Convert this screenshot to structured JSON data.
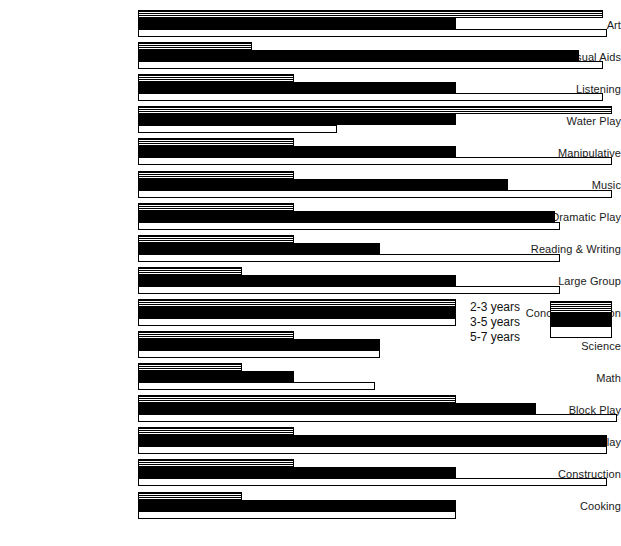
{
  "chart_data": {
    "type": "bar",
    "orientation": "horizontal",
    "title": "",
    "xlabel": "",
    "ylabel": "",
    "grid": false,
    "legend_position": "middle-right",
    "xlim": [
      0,
      100
    ],
    "categories": [
      "Art",
      "Visual Aids",
      "Listening",
      "Water Play",
      "Manipulative",
      "Music",
      "Dramatic Play",
      "Reading & Writing",
      "Large Group",
      "Concept Formation",
      "Science",
      "Math",
      "Block Play",
      "Indoor Active Play",
      "Construction",
      "Cooking"
    ],
    "series": [
      {
        "name": "2-3 years",
        "fill": "hatched",
        "values": [
          98,
          24,
          33,
          100,
          33,
          33,
          33,
          33,
          22,
          67,
          33,
          22,
          67,
          33,
          33,
          22
        ]
      },
      {
        "name": "3-5 years",
        "fill": "solid-black",
        "values": [
          67,
          93,
          67,
          67,
          67,
          78,
          88,
          51,
          67,
          67,
          51,
          33,
          84,
          99,
          67,
          67
        ]
      },
      {
        "name": "5-7 years",
        "fill": "white-outline",
        "values": [
          99,
          98,
          98,
          42,
          100,
          100,
          89,
          89,
          89,
          67,
          51,
          50,
          101,
          99,
          99,
          67
        ]
      }
    ]
  },
  "legend": {
    "entries": [
      {
        "label": "2-3 years",
        "swatch": "hatched-swatch"
      },
      {
        "label": "3-5 years",
        "swatch": "solid-black-swatch"
      },
      {
        "label": "5-7 years",
        "swatch": "white-outline-swatch"
      }
    ]
  }
}
